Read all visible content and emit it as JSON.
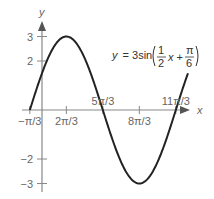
{
  "chart_data": {
    "type": "line",
    "title": "",
    "xlabel": "x",
    "ylabel": "y",
    "function": "y = 3sin(x/2 + π/6)",
    "equation": {
      "lhs": "y = 3sin",
      "frac1_num": "1",
      "frac1_den": "2",
      "var": "x +",
      "frac2_num": "π",
      "frac2_den": "6"
    },
    "xlim_over_pi": [
      -0.333,
      4.0
    ],
    "ylim": [
      -3.3,
      3.5
    ],
    "x_ticks": [
      {
        "label": "−π/3",
        "value_over_pi": -0.3333
      },
      {
        "label": "2π/3",
        "value_over_pi": 0.6667
      },
      {
        "label": "5π/3",
        "value_over_pi": 1.6667
      },
      {
        "label": "8π/3",
        "value_over_pi": 2.6667
      },
      {
        "label": "11π/3",
        "value_over_pi": 3.6667
      }
    ],
    "y_ticks": [
      {
        "label": "3",
        "value": 3
      },
      {
        "label": "2",
        "value": 2
      },
      {
        "label": "−2",
        "value": -2
      },
      {
        "label": "−3",
        "value": -3
      }
    ],
    "key_points": [
      {
        "x_over_pi": -0.3333,
        "y": 0
      },
      {
        "x_over_pi": 0.6667,
        "y": 3
      },
      {
        "x_over_pi": 1.6667,
        "y": 0
      },
      {
        "x_over_pi": 2.6667,
        "y": -3
      },
      {
        "x_over_pi": 3.6667,
        "y": 0
      }
    ],
    "grid": false
  }
}
